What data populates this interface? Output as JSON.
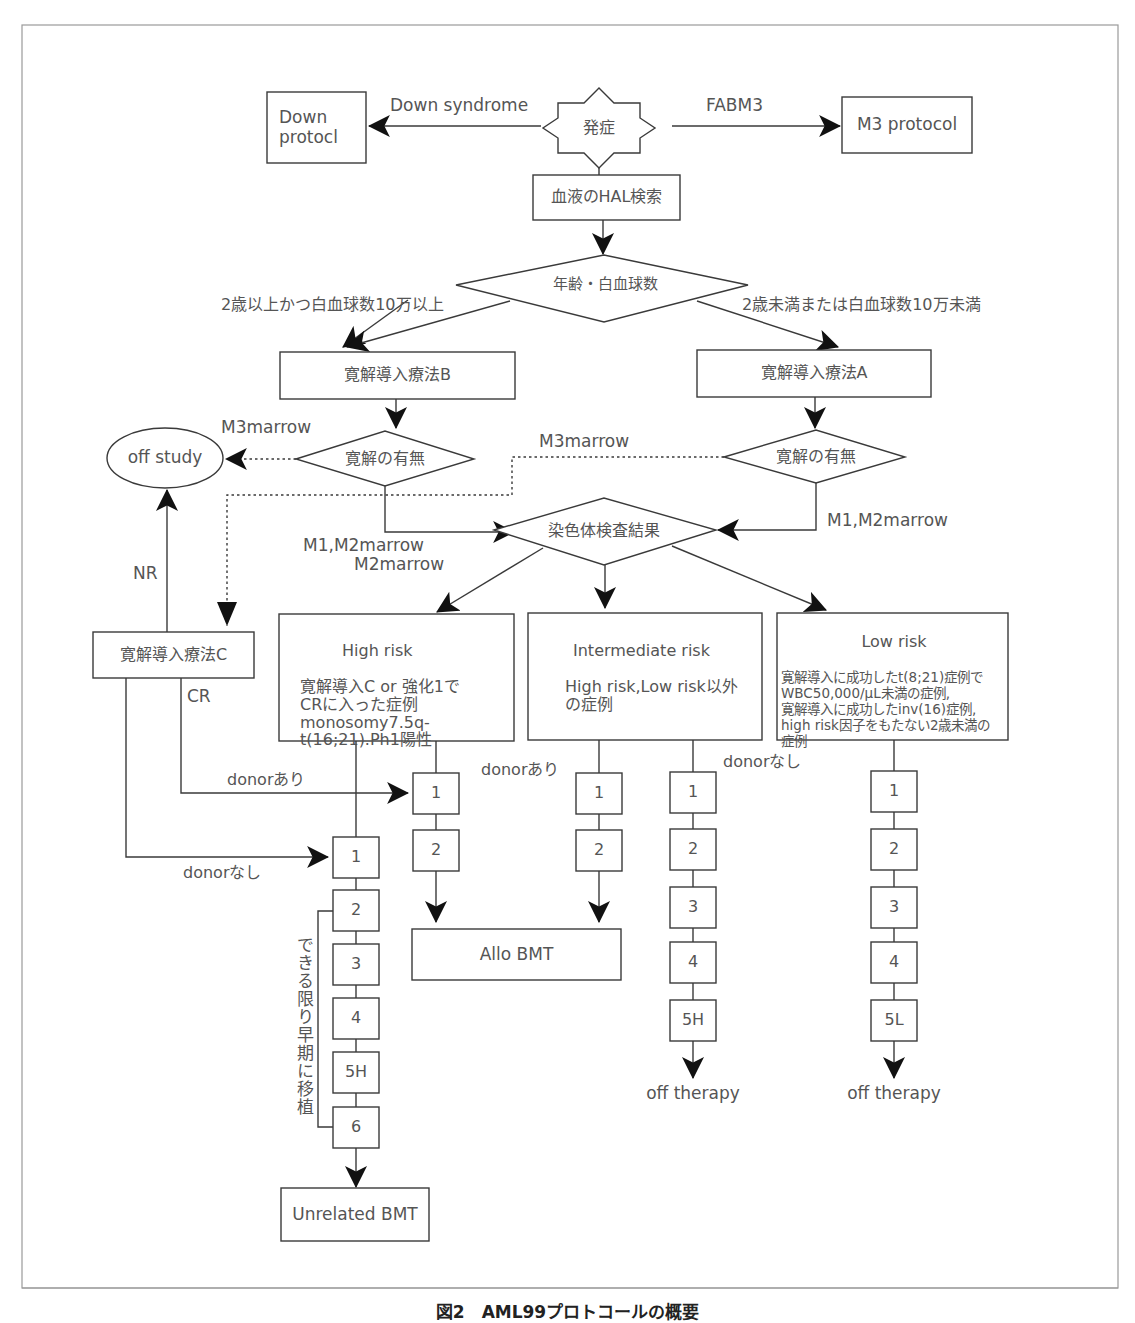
{
  "figure": {
    "caption": "図2　AML99プロトコールの概要"
  },
  "nodes": {
    "onset": "発症",
    "down_protocol": "Down\nprotocl",
    "m3_protocol": "M3 protocol",
    "hal_test": "血液のHAL検索",
    "age_wbc": "年齢・白血球数",
    "induction_b": "寛解導入療法B",
    "induction_a": "寛解導入療法A",
    "remission_left": "寛解の有無",
    "remission_right": "寛解の有無",
    "off_study": "off study",
    "chromosome_result": "染色体検査結果",
    "induction_c": "寛解導入療法C",
    "allo_bmt": "Allo BMT",
    "unrelated_bmt": "Unrelated BMT",
    "off_therapy_mid": "off therapy",
    "off_therapy_right": "off therapy"
  },
  "edges": {
    "down_syndrome": "Down syndrome",
    "fabm3": "FABM3",
    "age_high": "2歳以上かつ白血球数10万以上",
    "age_low": "2歳未満または白血球数10万未満",
    "m3marrow_left": "M3marrow",
    "m3marrow_right": "M3marrow",
    "m1m2_left_1": "M1,M2marrow",
    "m1m2_left_2": "M2marrow",
    "m1m2_right": "M1,M2marrow",
    "nr": "NR",
    "cr": "CR",
    "donor_yes_left": "donorあり",
    "donor_no_left": "donorなし",
    "donor_yes_mid": "donorあり",
    "donor_no_mid": "donorなし",
    "early_transplant": "できる限り早期に移植"
  },
  "risk_groups": {
    "high": {
      "title": "High risk",
      "body": "寛解導入C or 強化1で\nCRに入った症例\nmonosomy7.5q-\nt(16;21).Ph1陽性"
    },
    "intermediate": {
      "title": "Intermediate risk",
      "body": "High risk,Low risk以外\nの症例"
    },
    "low": {
      "title": "Low risk",
      "body": "寛解導入に成功したt(8;21)症例で\nWBC50,000/μL未満の症例,\n寛解導入に成功したinv(16)症例,\nhigh risk因子をもたない2歳未満の\n症例"
    }
  },
  "courses": {
    "high_donor_yes": [
      "1",
      "2"
    ],
    "high_donor_no": [
      "1",
      "2",
      "3",
      "4",
      "5H",
      "6"
    ],
    "intermediate_donor_yes": [
      "1",
      "2"
    ],
    "intermediate_donor_no": [
      "1",
      "2",
      "3",
      "4",
      "5H"
    ],
    "low": [
      "1",
      "2",
      "3",
      "4",
      "5L"
    ]
  }
}
